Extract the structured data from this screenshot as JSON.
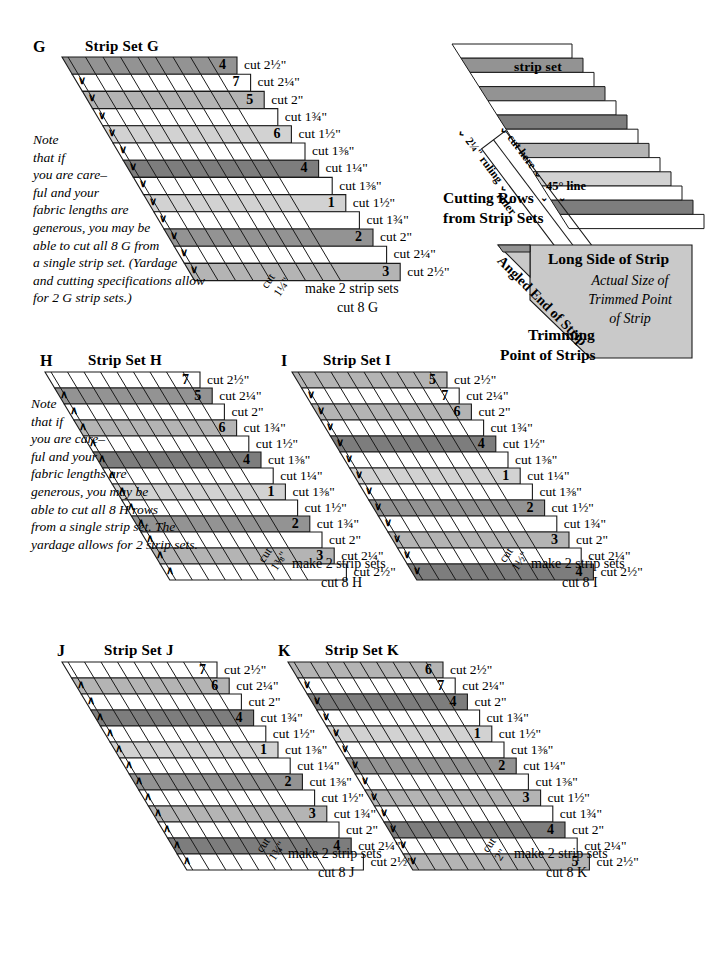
{
  "palette": {
    "white": "#ffffff",
    "light": "#d2d2d2",
    "medium": "#b4b4b4",
    "dark": "#939393",
    "darker": "#7d7d7d",
    "outline": "#1a1a1a",
    "panel_fill": "#c9c9c9"
  },
  "sets": [
    {
      "id": "G",
      "letter": "G",
      "title": "Strip Set G",
      "note": [
        "Note",
        "that if",
        "you are care–",
        "ful and your",
        "fabric lengths are",
        "generous, you may be",
        "able to cut all 8 G from",
        "a single strip set. (Yardage",
        "and cutting specifications allow",
        "for 2 G strip sets.)"
      ],
      "cut_tag": {
        "line1": "cut",
        "line2": "1¼\""
      },
      "make_line1": "make 2 strip sets",
      "make_line2": "cut 8 G",
      "chevron": "∨",
      "rows": [
        {
          "num": "4",
          "cut": "cut 2½\"",
          "shade": "dark"
        },
        {
          "num": "7",
          "cut": "cut 2¼\"",
          "shade": "white"
        },
        {
          "num": "5",
          "cut": "cut 2\"",
          "shade": "medium"
        },
        {
          "num": "",
          "cut": "cut 1¾\"",
          "shade": "white"
        },
        {
          "num": "6",
          "cut": "cut 1½\"",
          "shade": "light"
        },
        {
          "num": "",
          "cut": "cut 1⅜\"",
          "shade": "white"
        },
        {
          "num": "4",
          "cut": "cut 1¼\"",
          "shade": "darker"
        },
        {
          "num": "",
          "cut": "cut 1⅜\"",
          "shade": "white"
        },
        {
          "num": "1",
          "cut": "cut 1½\"",
          "shade": "light"
        },
        {
          "num": "",
          "cut": "cut 1¾\"",
          "shade": "white"
        },
        {
          "num": "2",
          "cut": "cut 2\"",
          "shade": "dark"
        },
        {
          "num": "",
          "cut": "cut 2¼\"",
          "shade": "white"
        },
        {
          "num": "3",
          "cut": "cut 2½\"",
          "shade": "medium"
        }
      ]
    },
    {
      "id": "H",
      "letter": "H",
      "title": "Strip Set H",
      "note": [
        "Note",
        "that if",
        "you are care–",
        "ful and your",
        "fabric lengths are",
        "generous, you may be",
        "able to cut all 8 H rows",
        "from a single strip set. The",
        "yardage allows for 2 strip sets."
      ],
      "cut_tag": {
        "line1": "cut",
        "line2": "1⅜\""
      },
      "make_line1": "make 2 strip sets",
      "make_line2": "cut 8 H",
      "chevron": "∧",
      "rows": [
        {
          "num": "7",
          "cut": "cut 2½\"",
          "shade": "white"
        },
        {
          "num": "5",
          "cut": "cut 2¼\"",
          "shade": "dark"
        },
        {
          "num": "",
          "cut": "cut 2\"",
          "shade": "white"
        },
        {
          "num": "6",
          "cut": "cut 1¾\"",
          "shade": "medium"
        },
        {
          "num": "",
          "cut": "cut 1½\"",
          "shade": "white"
        },
        {
          "num": "4",
          "cut": "cut 1⅜\"",
          "shade": "darker"
        },
        {
          "num": "",
          "cut": "cut 1¼\"",
          "shade": "white"
        },
        {
          "num": "1",
          "cut": "cut 1⅜\"",
          "shade": "light"
        },
        {
          "num": "",
          "cut": "cut 1½\"",
          "shade": "white"
        },
        {
          "num": "2",
          "cut": "cut 1¾\"",
          "shade": "dark"
        },
        {
          "num": "",
          "cut": "cut 2\"",
          "shade": "white"
        },
        {
          "num": "3",
          "cut": "cut 2¼\"",
          "shade": "medium"
        },
        {
          "num": "",
          "cut": "cut 2½\"",
          "shade": "white"
        }
      ]
    },
    {
      "id": "I",
      "letter": "I",
      "title": "Strip Set I",
      "note": [],
      "cut_tag": {
        "line1": "cut",
        "line2": "1½\""
      },
      "make_line1": "make 2 strip sets",
      "make_line2": "cut 8 I",
      "chevron": "∨",
      "rows": [
        {
          "num": "5",
          "cut": "cut 2½\"",
          "shade": "medium"
        },
        {
          "num": "7",
          "cut": "cut 2¼\"",
          "shade": "white"
        },
        {
          "num": "6",
          "cut": "cut 2\"",
          "shade": "medium"
        },
        {
          "num": "",
          "cut": "cut 1¾\"",
          "shade": "white"
        },
        {
          "num": "4",
          "cut": "cut 1½\"",
          "shade": "darker"
        },
        {
          "num": "",
          "cut": "cut 1⅜\"",
          "shade": "white"
        },
        {
          "num": "1",
          "cut": "cut 1¼\"",
          "shade": "light"
        },
        {
          "num": "",
          "cut": "cut 1⅜\"",
          "shade": "white"
        },
        {
          "num": "2",
          "cut": "cut 1½\"",
          "shade": "dark"
        },
        {
          "num": "",
          "cut": "cut 1¾\"",
          "shade": "white"
        },
        {
          "num": "3",
          "cut": "cut 2\"",
          "shade": "medium"
        },
        {
          "num": "",
          "cut": "cut 2¼\"",
          "shade": "white"
        },
        {
          "num": "4",
          "cut": "cut 2½\"",
          "shade": "darker"
        }
      ]
    },
    {
      "id": "J",
      "letter": "J",
      "title": "Strip Set J",
      "note": [],
      "cut_tag": {
        "line1": "cut",
        "line2": "1¾\""
      },
      "make_line1": "make 2 strip sets",
      "make_line2": "cut 8 J",
      "chevron": "∧",
      "rows": [
        {
          "num": "7",
          "cut": "cut 2½\"",
          "shade": "white"
        },
        {
          "num": "6",
          "cut": "cut 2¼\"",
          "shade": "medium"
        },
        {
          "num": "",
          "cut": "cut 2\"",
          "shade": "white"
        },
        {
          "num": "4",
          "cut": "cut 1¾\"",
          "shade": "darker"
        },
        {
          "num": "",
          "cut": "cut 1½\"",
          "shade": "white"
        },
        {
          "num": "1",
          "cut": "cut 1⅜\"",
          "shade": "light"
        },
        {
          "num": "",
          "cut": "cut 1¼\"",
          "shade": "white"
        },
        {
          "num": "2",
          "cut": "cut 1⅜\"",
          "shade": "dark"
        },
        {
          "num": "",
          "cut": "cut 1½\"",
          "shade": "white"
        },
        {
          "num": "3",
          "cut": "cut 1¾\"",
          "shade": "medium"
        },
        {
          "num": "",
          "cut": "cut 2\"",
          "shade": "white"
        },
        {
          "num": "4",
          "cut": "cut 2¼\"",
          "shade": "darker"
        },
        {
          "num": "",
          "cut": "cut 2½\"",
          "shade": "white"
        }
      ]
    },
    {
      "id": "K",
      "letter": "K",
      "title": "Strip Set K",
      "note": [],
      "cut_tag": {
        "line1": "cut",
        "line2": "2\""
      },
      "make_line1": "make 2 strip sets",
      "make_line2": "cut 8 K",
      "chevron": "∨",
      "rows": [
        {
          "num": "6",
          "cut": "cut 2½\"",
          "shade": "medium"
        },
        {
          "num": "7",
          "cut": "cut 2¼\"",
          "shade": "white"
        },
        {
          "num": "4",
          "cut": "cut 2\"",
          "shade": "darker"
        },
        {
          "num": "",
          "cut": "cut 1¾\"",
          "shade": "white"
        },
        {
          "num": "1",
          "cut": "cut 1½\"",
          "shade": "light"
        },
        {
          "num": "",
          "cut": "cut 1⅜\"",
          "shade": "white"
        },
        {
          "num": "2",
          "cut": "cut 1¼\"",
          "shade": "dark"
        },
        {
          "num": "",
          "cut": "cut 1⅜\"",
          "shade": "white"
        },
        {
          "num": "3",
          "cut": "cut 1½\"",
          "shade": "medium"
        },
        {
          "num": "",
          "cut": "cut 1¾\"",
          "shade": "white"
        },
        {
          "num": "4",
          "cut": "cut 2\"",
          "shade": "darker"
        },
        {
          "num": "",
          "cut": "cut 2¼\"",
          "shade": "white"
        },
        {
          "num": "5",
          "cut": "cut 2½\"",
          "shade": "medium"
        }
      ]
    }
  ],
  "cutting_diagram": {
    "strip_set_label": "strip set",
    "ruling_label": "2¼\" ruling",
    "cut_here_label": "cut here",
    "line45_label": "45° line",
    "ruler_label": "ruler",
    "caption_line1": "Cutting Rows",
    "caption_line2": "from Strip Sets",
    "stripe_shades": [
      "white",
      "dark",
      "white",
      "dark",
      "white",
      "darker",
      "white",
      "medium",
      "white",
      "light",
      "white",
      "darker",
      "white"
    ]
  },
  "trimming_diagram": {
    "long_side_label": "Long Side of Strip",
    "angled_end_label": "Angled End of Strip",
    "actual_size_lines": [
      "Actual Size of",
      "Trimmed Point",
      "of Strip"
    ],
    "caption_line1": "Trimming",
    "caption_line2": "Point of Strips"
  }
}
